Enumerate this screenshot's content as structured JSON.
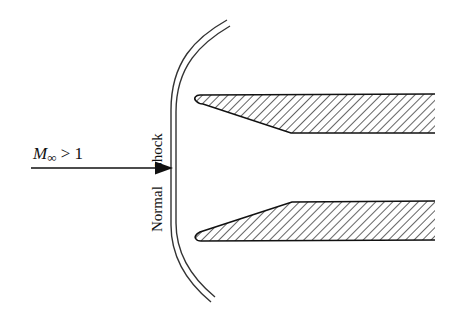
{
  "labels": {
    "mach_M": "M",
    "mach_sub": "∞",
    "mach_cond": " > 1",
    "shock_word_1": "Normal",
    "shock_word_2": "shock"
  },
  "elements": {
    "freestream_arrow": "flow-direction-arrow",
    "shock": "normal-shock-double-line",
    "upper_lip": "upper-inlet-lip-hatched",
    "lower_lip": "lower-inlet-lip-hatched"
  },
  "colors": {
    "line": "#111111",
    "shock": "#333333",
    "background": "#ffffff"
  }
}
